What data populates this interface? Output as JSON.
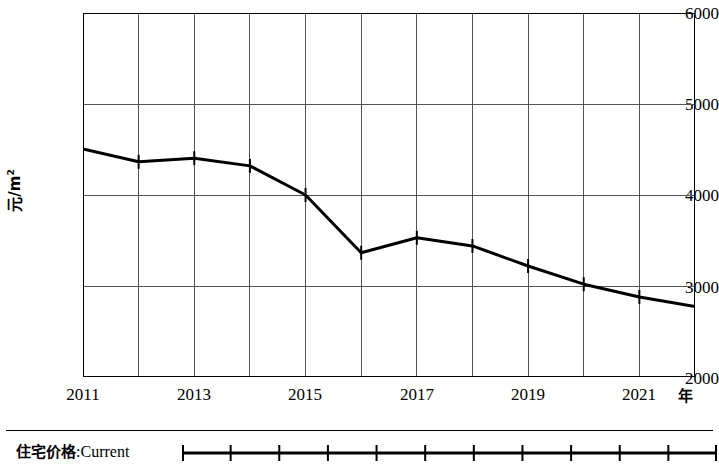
{
  "chart_data": {
    "type": "line",
    "title": "",
    "xlabel": "年",
    "ylabel": "元/m2",
    "ylabel_unit_base": "元/m",
    "ylabel_unit_exp": "2",
    "x": [
      2011,
      2012,
      2013,
      2014,
      2015,
      2016,
      2017,
      2018,
      2019,
      2020,
      2021,
      2022
    ],
    "xlim": [
      2011,
      2022
    ],
    "ylim": [
      2000,
      6000
    ],
    "yticks": [
      6000,
      5000,
      4000,
      3000,
      2000
    ],
    "ytick_labels": [
      "6000",
      "5000",
      "4000",
      "3000",
      "2000"
    ],
    "xticks": [
      2011,
      2013,
      2015,
      2017,
      2019,
      2021
    ],
    "xtick_labels": [
      "2011",
      "2013",
      "2015",
      "2017",
      "2019",
      "2021"
    ],
    "grid": true,
    "grid_x": true,
    "grid_y": true,
    "legend_position": "bottom",
    "line_color": "#000000",
    "marker": "tick",
    "series": [
      {
        "name": "住宅价格: Current",
        "name_cn": "住宅价格",
        "name_en": "Current",
        "values": [
          4505,
          4365,
          4405,
          4320,
          4000,
          3365,
          3530,
          3440,
          3220,
          3020,
          2880,
          2775
        ]
      }
    ]
  },
  "legend": {
    "label_cn": "住宅价格",
    "separator": ":",
    "label_en": "Current"
  },
  "axes": {
    "y_title_base": "元/m",
    "y_title_exp": "2",
    "x_unit": "年"
  }
}
